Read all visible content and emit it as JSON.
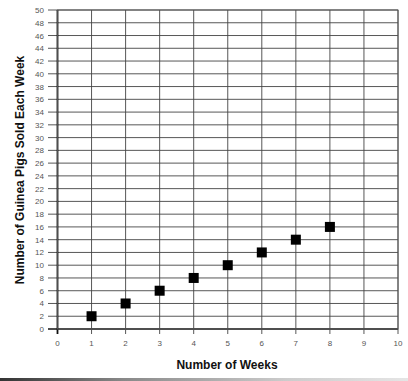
{
  "chart_data": {
    "type": "scatter",
    "title": "",
    "xlabel": "Number of Weeks",
    "ylabel": "Number of Guinea Pigs Sold Each Week",
    "xlim": [
      0,
      10
    ],
    "ylim": [
      0,
      50
    ],
    "x_ticks": [
      0,
      1,
      2,
      3,
      4,
      5,
      6,
      7,
      8,
      9,
      10
    ],
    "y_ticks": [
      0,
      2,
      4,
      6,
      8,
      10,
      12,
      14,
      16,
      18,
      20,
      22,
      24,
      26,
      28,
      30,
      32,
      34,
      36,
      38,
      40,
      42,
      44,
      46,
      48,
      50
    ],
    "grid": true,
    "legend": null,
    "marker": "square",
    "marker_color": "#000000",
    "series": [
      {
        "name": "Guinea Pigs Sold",
        "x": [
          1,
          2,
          3,
          4,
          5,
          6,
          7,
          8
        ],
        "y": [
          2,
          4,
          6,
          8,
          10,
          12,
          14,
          16
        ]
      }
    ]
  }
}
